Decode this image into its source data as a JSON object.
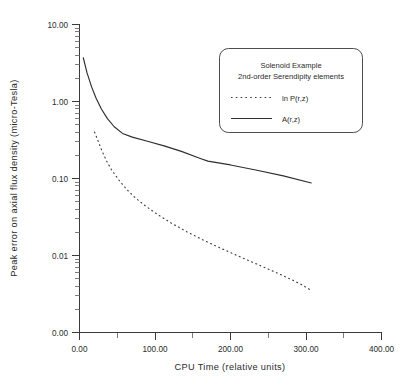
{
  "chart_data": {
    "type": "line",
    "title": "",
    "xlabel": "CPU Time (relative units)",
    "ylabel": "Peak error on axial flux density (micro-Tesla)",
    "yscale": "log",
    "xscale": "linear",
    "xlim": [
      0,
      400
    ],
    "ylim": [
      0.001,
      10.0
    ],
    "xticks": [
      0,
      100,
      200,
      300,
      400
    ],
    "xtick_labels": [
      "0.00",
      "100.00",
      "200.00",
      "300.00",
      "400.00"
    ],
    "yticks": [
      10.0,
      1.0,
      0.1,
      0.01,
      0.001
    ],
    "ytick_labels": [
      "10.00",
      "1.00",
      "0.10",
      "0.01",
      "0.00"
    ],
    "grid": false,
    "legend_position": "upper-right",
    "legend_title_lines": [
      "Solenoid Example",
      "2nd-order Serendipity elements"
    ],
    "series": [
      {
        "name": "ln P(r,z)",
        "style": "dotted",
        "color": "#3d3d3d",
        "x": [
          20,
          25,
          30,
          36,
          43,
          52,
          62,
          74,
          88,
          104,
          122,
          142,
          162,
          182,
          203,
          224,
          245,
          264,
          282,
          296,
          307
        ],
        "y": [
          0.4,
          0.3,
          0.225,
          0.168,
          0.127,
          0.096,
          0.073,
          0.056,
          0.0435,
          0.0338,
          0.0262,
          0.0204,
          0.0162,
          0.0131,
          0.0106,
          0.0086,
          0.007,
          0.0058,
          0.0048,
          0.0041,
          0.0035
        ]
      },
      {
        "name": "A(r,z)",
        "style": "solid",
        "color": "#2e2e2e",
        "x": [
          5,
          10,
          16,
          22,
          29,
          37,
          46,
          57,
          70,
          90,
          112,
          135,
          160,
          170,
          200,
          235,
          270,
          307
        ],
        "y": [
          3.7,
          2.35,
          1.55,
          1.1,
          0.8,
          0.6,
          0.47,
          0.385,
          0.345,
          0.305,
          0.265,
          0.225,
          0.182,
          0.168,
          0.15,
          0.128,
          0.108,
          0.0875
        ]
      }
    ],
    "legend_entries": [
      {
        "label": "ln P(r,z)",
        "style": "dotted"
      },
      {
        "label": "A(r,z)",
        "style": "solid"
      }
    ]
  }
}
